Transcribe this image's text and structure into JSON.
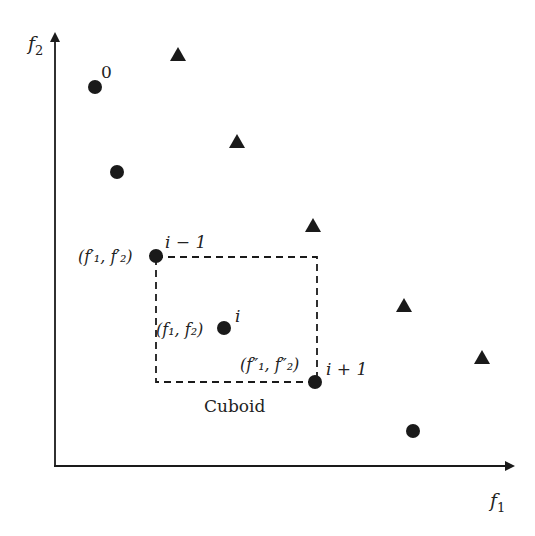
{
  "diagram": {
    "axes": {
      "x_label": "f",
      "x_sub": "1",
      "y_label": "f",
      "y_sub": "2"
    },
    "colors": {
      "ink": "#1a1a1a",
      "background": "#ffffff"
    },
    "circles": [
      {
        "x": 95,
        "y": 87,
        "label": "0"
      },
      {
        "x": 117,
        "y": 172,
        "label": ""
      },
      {
        "x": 156,
        "y": 256,
        "label": "i−1"
      },
      {
        "x": 224,
        "y": 328,
        "label": "i"
      },
      {
        "x": 315,
        "y": 382,
        "label": "i+1"
      },
      {
        "x": 413,
        "y": 431,
        "label": ""
      }
    ],
    "triangles": [
      {
        "x": 178,
        "y": 55
      },
      {
        "x": 237,
        "y": 142
      },
      {
        "x": 313,
        "y": 226
      },
      {
        "x": 404,
        "y": 306
      },
      {
        "x": 482,
        "y": 358
      }
    ],
    "point_labels": {
      "zero": "0",
      "prev": "i − 1",
      "cur": "i",
      "next": "i + 1",
      "prev_coord": "(f′₁, f′₂)",
      "cur_coord": "(f₁, f₂)",
      "next_coord": "(f″₁, f″₂)"
    },
    "cuboid": {
      "label": "Cuboid",
      "x1": 156,
      "y1": 257,
      "x2": 317,
      "y2": 382
    }
  }
}
